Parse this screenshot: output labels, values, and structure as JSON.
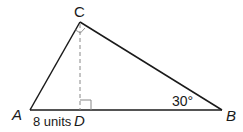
{
  "diagram": {
    "type": "right-triangle-with-altitude",
    "vertices": {
      "A": {
        "label": "A",
        "x": 30,
        "y": 110
      },
      "B": {
        "label": "B",
        "x": 222,
        "y": 110
      },
      "C": {
        "label": "C",
        "x": 80,
        "y": 22
      },
      "D": {
        "label": "D",
        "x": 80,
        "y": 110
      }
    },
    "segment_labels": {
      "AD": "8 units"
    },
    "angle_labels": {
      "B": "30°"
    },
    "right_angles": [
      "C",
      "D"
    ],
    "altitude": {
      "from": "C",
      "to": "D",
      "style": "dashed"
    },
    "colors": {
      "stroke": "#1a1a1a",
      "altitude": "#888888",
      "background": "#ffffff"
    }
  }
}
